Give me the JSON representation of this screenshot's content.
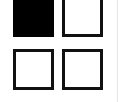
{
  "grid": {
    "columns": 2,
    "rows": 2,
    "cells": [
      {
        "state": "filled",
        "color": "#000000"
      },
      {
        "state": "empty",
        "color": "#ffffff"
      },
      {
        "state": "empty",
        "color": "#ffffff"
      },
      {
        "state": "empty",
        "color": "#ffffff"
      }
    ],
    "border_color": "#111111"
  }
}
